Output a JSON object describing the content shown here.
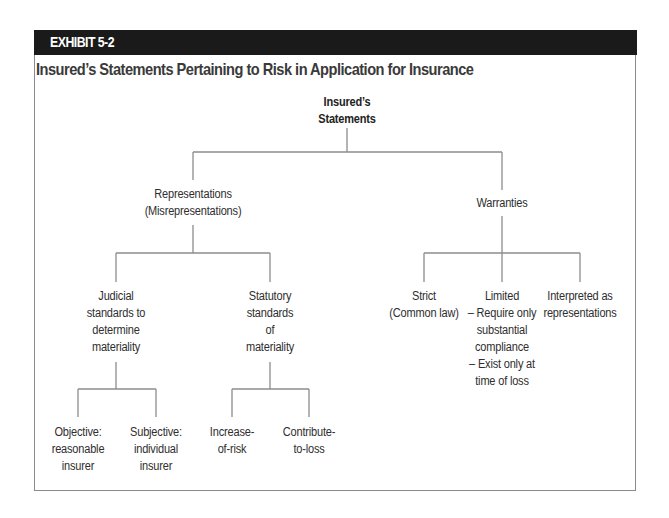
{
  "exhibit": {
    "label": "EXHIBIT 5-2",
    "title": "Insured’s Statements Pertaining to Risk in Application for Insurance"
  },
  "diagram": {
    "root": {
      "lines": [
        "Insured’s",
        "Statements"
      ]
    },
    "representations": {
      "lines": [
        "Representations",
        "(Misrepresentations)"
      ],
      "judicial": {
        "lines": [
          "Judicial",
          "standards to",
          "determine",
          "materiality"
        ],
        "children": [
          {
            "lines": [
              "Objective:",
              "reasonable",
              "insurer"
            ]
          },
          {
            "lines": [
              "Subjective:",
              "individual",
              "insurer"
            ]
          }
        ]
      },
      "statutory": {
        "lines": [
          "Statutory",
          "standards",
          "of",
          "materiality"
        ],
        "children": [
          {
            "lines": [
              "Increase-",
              "of-risk"
            ]
          },
          {
            "lines": [
              "Contribute-",
              "to-loss"
            ]
          }
        ]
      }
    },
    "warranties": {
      "lines": [
        "Warranties"
      ],
      "children": [
        {
          "lines": [
            "Strict",
            "(Common law)"
          ]
        },
        {
          "lines": [
            "Limited",
            "– Require only",
            "substantial",
            "compliance",
            "– Exist only at",
            "time of loss"
          ]
        },
        {
          "lines": [
            "Interpreted as",
            "representations"
          ]
        }
      ]
    }
  },
  "colors": {
    "band": "#1a1a1a",
    "lines": "#8c8c8c",
    "text": "#2e2e2e"
  }
}
